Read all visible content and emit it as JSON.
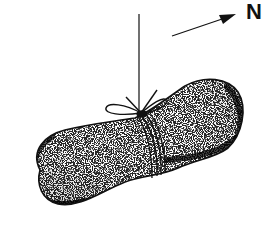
{
  "figure": {
    "direction_label": "N",
    "colors": {
      "ink": "#111111",
      "background": "#ffffff",
      "stone_fill": "#ffffff"
    }
  }
}
